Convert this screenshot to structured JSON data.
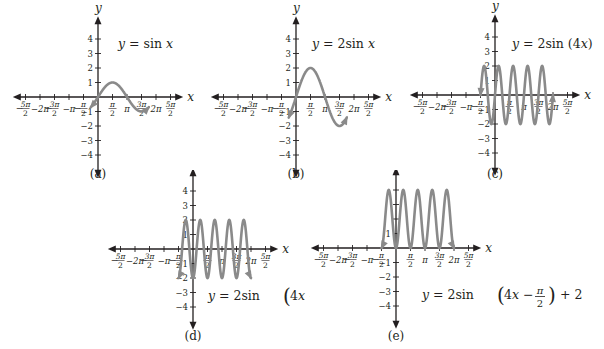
{
  "figure": {
    "curve_color": "#8a8a8a",
    "axis_color": "#231f20"
  },
  "axes": {
    "x_label": "x",
    "y_label": "y",
    "x_ticks": [
      "-5π/2",
      "-2π",
      "-3π/2",
      "-π",
      "-π/2",
      "π/2",
      "π",
      "3π/2",
      "2π",
      "5π/2"
    ],
    "y_ticks": [
      "4",
      "3",
      "2",
      "1",
      "-1",
      "-2",
      "-3",
      "-4"
    ]
  },
  "panels": [
    {
      "id": "a",
      "caption": "(a)",
      "equation": "y = sin x",
      "amplitude": 1,
      "frequency": 1,
      "phase": 0,
      "shift": 0,
      "x_start": "-π/4",
      "x_end": "7π/4"
    },
    {
      "id": "b",
      "caption": "(b)",
      "equation": "y = 2sin x",
      "amplitude": 2,
      "frequency": 1,
      "phase": 0,
      "shift": 0,
      "x_start": "-π/4",
      "x_end": "7π/4"
    },
    {
      "id": "c",
      "caption": "(c)",
      "equation": "y = 2sin (4x)",
      "amplitude": 2,
      "frequency": 4,
      "phase": 0,
      "shift": 0,
      "x_start": "-π/2",
      "x_end": "2π"
    },
    {
      "id": "d",
      "caption": "(d)",
      "equation": "y = 2sin(4x − π/2)",
      "amplitude": 2,
      "frequency": 4,
      "phase": "π/2",
      "shift": 0,
      "x_start": "-π/2",
      "x_end": "2π"
    },
    {
      "id": "e",
      "caption": "(e)",
      "equation": "y = 2sin(4x − π/2) + 2",
      "amplitude": 2,
      "frequency": 4,
      "phase": "π/2",
      "shift": 2,
      "x_start": "-π/2",
      "x_end": "2π"
    }
  ],
  "labels": {
    "a_eq_main": "y = sin x",
    "b_eq_main": "y = 2sin x",
    "c_eq_main": "y = 2sin (4x)",
    "d_eq_prefix": "y = 2sin",
    "d_eq_inner": "4x −",
    "e_eq_prefix": "y = 2sin",
    "e_eq_inner": "4x −",
    "e_eq_suffix": "+ 2",
    "pi": "π",
    "two": "2"
  }
}
